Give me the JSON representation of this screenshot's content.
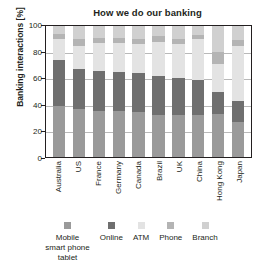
{
  "chart_data": {
    "type": "bar",
    "subtype": "stacked-bar-percent",
    "title": "How we do our banking",
    "xlabel": "",
    "ylabel": "Banking interactions [%]",
    "ylim": [
      0,
      100
    ],
    "yticks": [
      0,
      20,
      40,
      60,
      80,
      100
    ],
    "ytick_labels": [
      "0",
      "20",
      "40",
      "60",
      "80",
      "100"
    ],
    "grid": true,
    "legend_position": "bottom",
    "categories": [
      "Australia",
      "US",
      "France",
      "Germany",
      "Canada",
      "Brazil",
      "UK",
      "China",
      "Hong Kong",
      "Japan"
    ],
    "series": [
      {
        "name": "Mobile smart phone tablet",
        "color": "#9a9a9a",
        "values": [
          39,
          37,
          35,
          35,
          34,
          32,
          32,
          32,
          33,
          27
        ]
      },
      {
        "name": "Online",
        "color": "#6f6f6f",
        "values": [
          35,
          30,
          31,
          30,
          30,
          30,
          28,
          27,
          17,
          16
        ]
      },
      {
        "name": "ATM",
        "color": "#e3e3e3",
        "values": [
          16,
          18,
          21,
          22,
          22,
          26,
          26,
          31,
          21,
          42
        ]
      },
      {
        "name": "Phone",
        "color": "#b4b4b4",
        "values": [
          4,
          5,
          4,
          4,
          4,
          4,
          4,
          3,
          9,
          4
        ]
      },
      {
        "name": "Branch",
        "color": "#d0d0d0",
        "values": [
          6,
          10,
          9,
          9,
          10,
          8,
          10,
          7,
          20,
          11
        ]
      }
    ]
  },
  "legend": {
    "items": [
      {
        "label": "Mobile\nsmart phone\ntablet",
        "line1": "Mobile",
        "line2": "smart phone",
        "line3": "tablet",
        "color": "#9a9a9a"
      },
      {
        "label": "Online",
        "line1": "Online",
        "line2": "",
        "line3": "",
        "color": "#6f6f6f"
      },
      {
        "label": "ATM",
        "line1": "ATM",
        "line2": "",
        "line3": "",
        "color": "#e3e3e3"
      },
      {
        "label": "Phone",
        "line1": "Phone",
        "line2": "",
        "line3": "",
        "color": "#b4b4b4"
      },
      {
        "label": "Branch",
        "line1": "Branch",
        "line2": "",
        "line3": "",
        "color": "#d0d0d0"
      }
    ]
  },
  "style": {
    "axis_color": "#231f20",
    "grid_color": "#b9b9b9",
    "background": "#ffffff"
  }
}
